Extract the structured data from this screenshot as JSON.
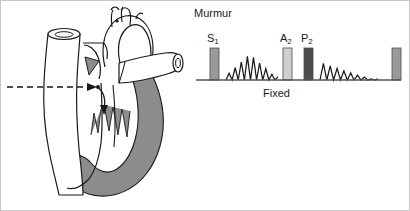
{
  "figure": {
    "background_color": "#ffffff",
    "border_color": "#c8c8c8",
    "width": 410,
    "height": 211
  },
  "heart_diagram": {
    "name": "heart-cross-section",
    "description": "Cross-sectional line drawing of the heart with great vessels, showing a left-to-right shunt across the atrial septum",
    "outline_color": "#1a1a1a",
    "shaded_chamber_color": "#8c8c8c",
    "shaded_chamber_label": "right heart chambers",
    "unshaded_chamber_color": "#ffffff",
    "shunt_arrow": {
      "name": "shunt-flow-arrow",
      "style": "dashed horizontal arrow with curved descending continuation",
      "direction": "left-to-right then downward",
      "color": "#1a1a1a"
    },
    "vessels": [
      "superior vena cava",
      "aortic arch",
      "brachiocephalic branches",
      "pulmonary artery",
      "descending aorta"
    ]
  },
  "phonocardiogram": {
    "murmur_label": "Murmur",
    "splitting_label": "Fixed",
    "baseline_color": "#555555",
    "sounds": [
      {
        "id": "s1",
        "label": "S",
        "subscript": "1",
        "x": 14,
        "width": 9,
        "height": 32,
        "color": "#9a9a9a",
        "show_label": true
      },
      {
        "id": "a2",
        "label": "A",
        "subscript": "2",
        "x": 87,
        "width": 9,
        "height": 32,
        "color": "#cfcfcf",
        "show_label": true
      },
      {
        "id": "p2",
        "label": "P",
        "subscript": "2",
        "x": 108,
        "width": 9,
        "height": 32,
        "color": "#4d4d4d",
        "show_label": true
      },
      {
        "id": "s1-next",
        "label": "",
        "subscript": "",
        "x": 196,
        "width": 9,
        "height": 32,
        "color": "#9a9a9a",
        "show_label": false
      }
    ],
    "murmurs": [
      {
        "id": "systolic-murmur",
        "shape": "crescendo-decrescendo (diamond)",
        "x_start": 30,
        "x_end": 82,
        "peak_height": 26,
        "color": "#1a1a1a"
      },
      {
        "id": "diastolic-flow-rumble",
        "shape": "decrescendo (tapering)",
        "x_start": 124,
        "x_end": 182,
        "peak_height": 18,
        "color": "#1a1a1a"
      }
    ]
  },
  "chart_data": {
    "type": "line",
    "xlabel": "Fixed",
    "ylabel": "",
    "annotations": [
      "Murmur",
      "Fixed"
    ],
    "categories": [
      "S1",
      "systolic murmur",
      "A2",
      "P2",
      "diastolic rumble",
      "S1 (next cycle)"
    ],
    "values": [
      32,
      26,
      32,
      32,
      18,
      32
    ],
    "series": [
      {
        "name": "heart sound amplitude",
        "values": [
          32,
          26,
          32,
          32,
          18,
          32
        ]
      }
    ],
    "grid": false,
    "legend_position": "none"
  }
}
